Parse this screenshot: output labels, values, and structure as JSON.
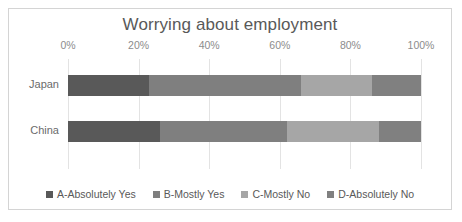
{
  "chart_data": {
    "type": "bar",
    "orientation": "horizontal",
    "stacked": true,
    "stacked_mode": "percent",
    "title": "Worrying about employment",
    "xlabel": "",
    "ylabel": "",
    "categories": [
      "Japan",
      "China"
    ],
    "xlim": [
      0,
      100
    ],
    "xticks": [
      0,
      20,
      40,
      60,
      80,
      100
    ],
    "xtick_labels": [
      "0%",
      "20%",
      "40%",
      "60%",
      "80%",
      "100%"
    ],
    "grid": true,
    "grid_axis": "x",
    "legend_position": "bottom",
    "series": [
      {
        "name": "A-Absolutely Yes",
        "color": "#595959",
        "values": [
          23,
          26
        ]
      },
      {
        "name": "B-Mostly Yes",
        "color": "#7f7f7f",
        "values": [
          43,
          36
        ]
      },
      {
        "name": "C-Mostly No",
        "color": "#a6a6a6",
        "values": [
          20,
          26
        ]
      },
      {
        "name": "D-Absolutely No",
        "color": "#808080",
        "values": [
          14,
          12
        ]
      }
    ]
  },
  "style": {
    "frame_border_color": "#d4d4d4",
    "background": "#ffffff",
    "title_color": "#595959",
    "tick_color": "#8c8c8c",
    "gridline_color": "#e3e3e3"
  }
}
